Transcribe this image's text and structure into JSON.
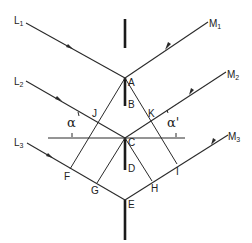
{
  "diagram": {
    "incident_rays": [
      {
        "label": "L",
        "subscript": "1"
      },
      {
        "label": "L",
        "subscript": "2"
      },
      {
        "label": "L",
        "subscript": "3"
      }
    ],
    "reflected_rays": [
      {
        "label": "M",
        "subscript": "1"
      },
      {
        "label": "M",
        "subscript": "2"
      },
      {
        "label": "M",
        "subscript": "3"
      }
    ],
    "points": {
      "A": "A",
      "B": "B",
      "C": "C",
      "D": "D",
      "E": "E",
      "F": "F",
      "G": "G",
      "H": "H",
      "I": "I",
      "J": "J",
      "K": "K"
    },
    "angles": {
      "left": "α",
      "right": "α'"
    }
  }
}
